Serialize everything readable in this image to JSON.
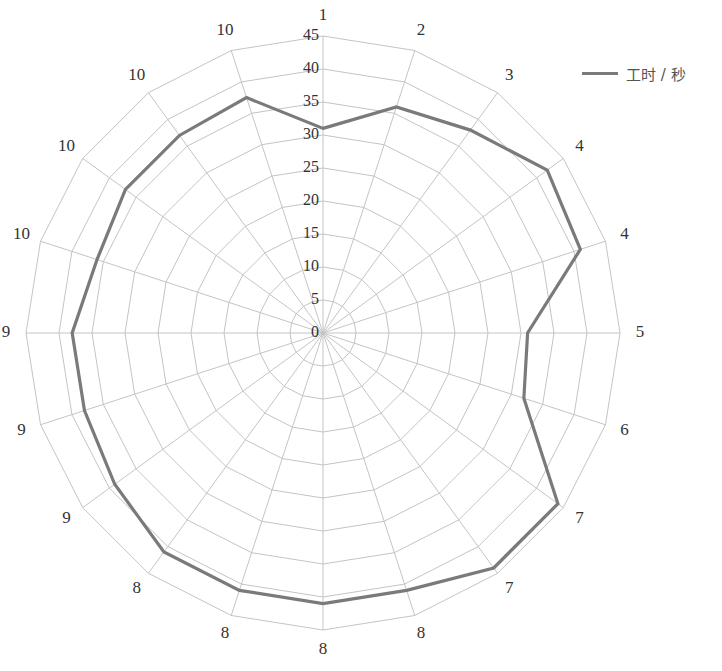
{
  "chart_data": {
    "type": "radar",
    "title": "",
    "categories": [
      "1",
      "2",
      "3",
      "4",
      "4",
      "5",
      "6",
      "7",
      "7",
      "8",
      "8",
      "8",
      "8",
      "9",
      "9",
      "9",
      "10",
      "10",
      "10",
      "10"
    ],
    "series": [
      {
        "name": "工时 / 秒",
        "color": "#7a7a7a",
        "values": [
          31,
          36,
          38,
          42,
          41,
          31,
          32,
          44,
          44,
          41,
          41,
          41,
          41,
          39,
          38,
          38,
          36,
          37,
          37,
          37.5
        ]
      }
    ],
    "radial_axis": {
      "min": 0,
      "max": 45,
      "step": 5,
      "tick_labels": [
        "0",
        "5",
        "10",
        "15",
        "20",
        "25",
        "30",
        "35",
        "40",
        "45"
      ]
    },
    "grid": true,
    "legend_position": "top-right"
  },
  "legend": {
    "label": "工时 / 秒",
    "color": "#7a7a7a"
  },
  "layout": {
    "cx": 323,
    "cy": 333,
    "px_per_unit": 6.6,
    "label_offset": 20,
    "grid_color": "#c4c4c4"
  }
}
